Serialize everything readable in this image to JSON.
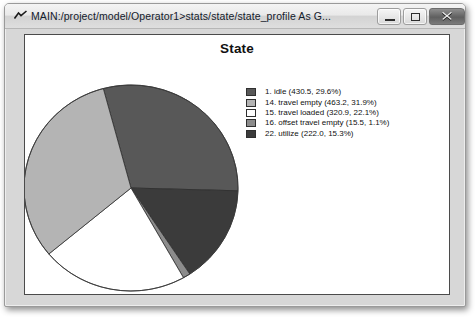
{
  "window": {
    "title": "MAIN:/project/model/Operator1>stats/state/state_profile As G...",
    "icon_name": "chart-peak-icon",
    "controls": {
      "minimize_label": "Minimize",
      "maximize_label": "Maximize",
      "close_label": "Close"
    }
  },
  "chart_data": {
    "type": "pie",
    "title": "State",
    "xlabel": "",
    "ylabel": "",
    "grid": false,
    "legend_position": "right",
    "start_angle": -15,
    "clockwise_order": [
      0,
      4,
      3,
      2,
      1
    ],
    "units_note": "(time, percent of total)",
    "total_value": 1452.1,
    "categories": [
      "1. idle",
      "14. travel empty",
      "15. travel loaded",
      "16. offset travel empty",
      "22. utilize"
    ],
    "values": [
      430.5,
      463.2,
      320.9,
      15.5,
      222.0
    ],
    "percents": [
      29.6,
      31.9,
      22.1,
      1.1,
      15.3
    ],
    "colors": [
      "#585858",
      "#b4b4b4",
      "#ffffff",
      "#8c8c8c",
      "#3b3b3b"
    ],
    "slices": [
      {
        "label": "1. idle",
        "value": 430.5,
        "percent": 29.6,
        "color": "#585858",
        "legend": "1. idle (430.5, 29.6%)"
      },
      {
        "label": "14. travel empty",
        "value": 463.2,
        "percent": 31.9,
        "color": "#b4b4b4",
        "legend": "14. travel empty (463.2, 31.9%)"
      },
      {
        "label": "15. travel loaded",
        "value": 320.9,
        "percent": 22.1,
        "color": "#ffffff",
        "legend": "15. travel loaded (320.9, 22.1%)"
      },
      {
        "label": "16. offset travel empty",
        "value": 15.5,
        "percent": 1.1,
        "color": "#8c8c8c",
        "legend": "16. offset travel empty (15.5, 1.1%)"
      },
      {
        "label": "22. utilize",
        "value": 222.0,
        "percent": 15.3,
        "color": "#3b3b3b",
        "legend": "22. utilize (222.0, 15.3%)"
      }
    ]
  }
}
